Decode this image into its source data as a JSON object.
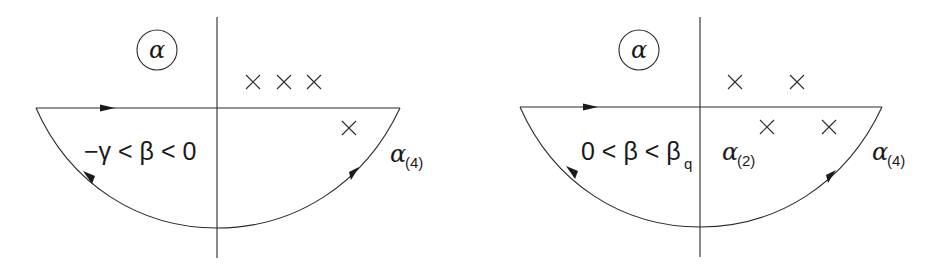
{
  "figure": {
    "panels": [
      {
        "id": "left",
        "plane_label": "α",
        "region_label": {
          "prefix": "−γ < β < 0"
        },
        "contour_label": {
          "symbol": "α",
          "subscript": "(4)"
        },
        "inner_label": null,
        "poles_upper": 3,
        "poles_lower": 1
      },
      {
        "id": "right",
        "plane_label": "α",
        "region_label": {
          "prefix": "0 < β < β",
          "subscript": "q"
        },
        "contour_label": {
          "symbol": "α",
          "subscript": "(4)"
        },
        "inner_label": {
          "symbol": "α",
          "subscript": "(2)"
        },
        "poles_upper": 2,
        "poles_lower": 2
      }
    ],
    "colors": {
      "line": "#2a2a2a",
      "text": "#1a1a1a",
      "background": "#ffffff"
    }
  }
}
